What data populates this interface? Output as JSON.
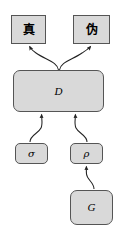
{
  "diagram": {
    "background_color": "#ffffff",
    "node_fill_color": "#d9d9d9",
    "node_stroke_color": "#555555",
    "edge_color": "#222222",
    "nodes": [
      {
        "id": "true",
        "label": "真",
        "shape": "rectangle",
        "name": "true-node"
      },
      {
        "id": "fake",
        "label": "伪",
        "shape": "rectangle",
        "name": "fake-node"
      },
      {
        "id": "d",
        "label": "D",
        "shape": "rounded-rectangle",
        "name": "discriminator-node"
      },
      {
        "id": "sigma",
        "label": "σ",
        "shape": "rounded-rectangle",
        "name": "sigma-node"
      },
      {
        "id": "rho",
        "label": "ρ",
        "shape": "rounded-rectangle",
        "name": "rho-node"
      },
      {
        "id": "g",
        "label": "G",
        "shape": "rounded-rectangle",
        "name": "generator-node"
      }
    ],
    "edges": [
      {
        "from": "d",
        "to": "true",
        "arrowhead": "filled",
        "name": "edge-d-to-true"
      },
      {
        "from": "d",
        "to": "fake",
        "arrowhead": "filled",
        "name": "edge-d-to-fake"
      },
      {
        "from": "sigma",
        "to": "d",
        "arrowhead": "filled",
        "name": "edge-sigma-to-d"
      },
      {
        "from": "rho",
        "to": "d",
        "arrowhead": "filled",
        "name": "edge-rho-to-d"
      },
      {
        "from": "g",
        "to": "rho",
        "arrowhead": "filled",
        "name": "edge-g-to-rho"
      }
    ]
  }
}
